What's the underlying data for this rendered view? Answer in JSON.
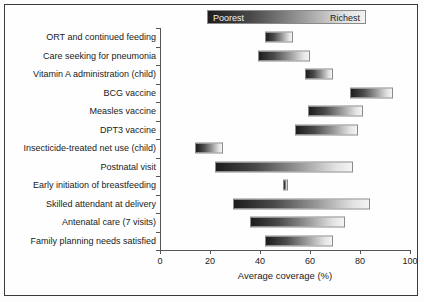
{
  "chart_data": {
    "type": "bar",
    "title": "",
    "xlabel": "Average coverage (%)",
    "ylabel": "",
    "xlim": [
      0,
      100
    ],
    "xticks": [
      0,
      20,
      40,
      60,
      80,
      100
    ],
    "xticklabels": [
      "0",
      "20",
      "40",
      "60",
      "80",
      "100"
    ],
    "grid": false,
    "orientation": "horizontal",
    "legend": {
      "position": "top",
      "low_label": "Poorest",
      "high_label": "Richest",
      "gradient_from": "#1d1d1d",
      "gradient_to": "#f2f2f2"
    },
    "bar_meaning": "Each bar spans from the coverage of the poorest wealth quintile (dark, left end) to the richest quintile (light, right end).",
    "categories": [
      "ORT and continued feeding",
      "Care seeking for pneumonia",
      "Vitamin A administration (child)",
      "BCG vaccine",
      "Measles vaccine",
      "DPT3 vaccine",
      "Insecticide-treated net use (child)",
      "Postnatal visit",
      "Early initiation of breastfeeding",
      "Skilled attendant at delivery",
      "Antenatal care (7 visits)",
      "Family planning needs satisfied"
    ],
    "series": [
      {
        "name": "Poorest",
        "values": [
          42,
          39,
          58,
          76,
          59,
          54,
          14,
          22,
          49,
          29,
          36,
          42
        ]
      },
      {
        "name": "Richest",
        "values": [
          53,
          60,
          69,
          93,
          81,
          79,
          25,
          77,
          51,
          84,
          74,
          69
        ]
      }
    ]
  }
}
